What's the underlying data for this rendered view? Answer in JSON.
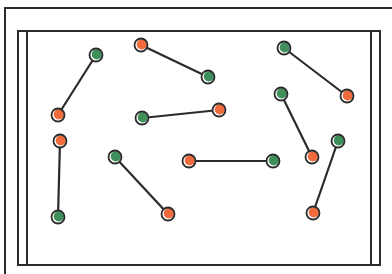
{
  "diagram": {
    "type": "matched-pairs-dot-diagram",
    "colors": {
      "background": "#ffffff",
      "frame": "#2b2b2b",
      "line": "#2b2b2b",
      "dot_green": "#3f8f5a",
      "dot_orange": "#f06a3c",
      "dot_outline": "#2b2b2b"
    },
    "frame": {
      "outer": {
        "x": 5,
        "y": 8
      },
      "inner_left_1": 18,
      "inner_left_2": 27,
      "inner_top": 31,
      "inner_right_1": 371,
      "inner_right_2": 380,
      "inner_bottom": 265
    },
    "dot_radius": 6.5,
    "pairs": [
      {
        "a": {
          "x": 96,
          "y": 55,
          "color": "green"
        },
        "b": {
          "x": 58,
          "y": 115,
          "color": "orange"
        }
      },
      {
        "a": {
          "x": 141,
          "y": 45,
          "color": "orange"
        },
        "b": {
          "x": 208,
          "y": 77,
          "color": "green"
        }
      },
      {
        "a": {
          "x": 284,
          "y": 48,
          "color": "green"
        },
        "b": {
          "x": 347,
          "y": 96,
          "color": "orange"
        }
      },
      {
        "a": {
          "x": 142,
          "y": 118,
          "color": "green"
        },
        "b": {
          "x": 219,
          "y": 110,
          "color": "orange"
        }
      },
      {
        "a": {
          "x": 281,
          "y": 94,
          "color": "green"
        },
        "b": {
          "x": 312,
          "y": 157,
          "color": "orange"
        }
      },
      {
        "a": {
          "x": 60,
          "y": 141,
          "color": "orange"
        },
        "b": {
          "x": 58,
          "y": 217,
          "color": "green"
        }
      },
      {
        "a": {
          "x": 115,
          "y": 157,
          "color": "green"
        },
        "b": {
          "x": 168,
          "y": 214,
          "color": "orange"
        }
      },
      {
        "a": {
          "x": 189,
          "y": 161,
          "color": "orange"
        },
        "b": {
          "x": 273,
          "y": 161,
          "color": "green"
        }
      },
      {
        "a": {
          "x": 338,
          "y": 141,
          "color": "green"
        },
        "b": {
          "x": 313,
          "y": 213,
          "color": "orange"
        }
      }
    ]
  }
}
